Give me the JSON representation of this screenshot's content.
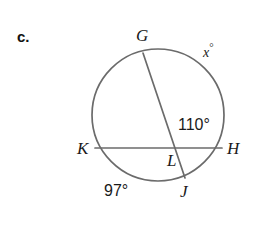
{
  "figure": {
    "problem_letter": "c.",
    "type": "circle-with-two-intersecting-chords",
    "stroke_color": "#6b6b6b",
    "text_color": "#1a1a1a",
    "background_color": "#ffffff",
    "circle": {
      "center_x": 158,
      "center_y": 115,
      "radius": 66
    },
    "points": [
      {
        "name": "G",
        "label": "G",
        "x": 143,
        "y": 53,
        "on": "circle"
      },
      {
        "name": "K",
        "label": "K",
        "x": 95,
        "y": 148,
        "on": "circle"
      },
      {
        "name": "H",
        "label": "H",
        "x": 222,
        "y": 148,
        "on": "circle"
      },
      {
        "name": "J",
        "label": "J",
        "x": 185,
        "y": 178,
        "on": "circle"
      },
      {
        "name": "L",
        "label": "L",
        "x": 175,
        "y": 148,
        "on": "chord-intersection"
      }
    ],
    "chords": [
      {
        "name": "chord-KH",
        "from": "K",
        "to": "H",
        "x1": 95,
        "y1": 148,
        "x2": 222,
        "y2": 148
      },
      {
        "name": "chord-GJ",
        "from": "G",
        "to": "J",
        "x1": 143,
        "y1": 53,
        "x2": 185,
        "y2": 178
      }
    ],
    "labels": {
      "point_G": "G",
      "point_K": "K",
      "point_H": "H",
      "point_J": "J",
      "point_L": "L",
      "angle_GLH": "110°",
      "arc_KJ": "97°",
      "arc_GH_variable": "x",
      "arc_GH_degree_symbol": "°"
    }
  }
}
